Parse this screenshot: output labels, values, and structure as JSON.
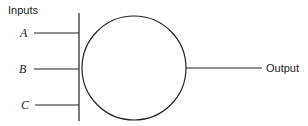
{
  "diagram": {
    "inputs_label": "Inputs",
    "output_label": "Output",
    "inputs": [
      {
        "label": "A",
        "y": 33
      },
      {
        "label": "B",
        "y": 69
      },
      {
        "label": "C",
        "y": 105
      }
    ],
    "node": {
      "shape": "circle",
      "cx": 134,
      "cy": 68,
      "r": 52
    },
    "bus": {
      "x": 79,
      "y1": 13,
      "y2": 121
    },
    "output_line": {
      "x1": 186,
      "x2": 262,
      "y": 68
    }
  }
}
